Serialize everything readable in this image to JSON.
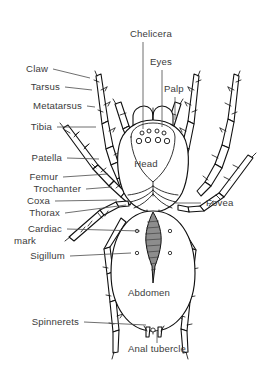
{
  "figure": {
    "view": "dorsal",
    "background_color": "#ffffff",
    "line_color": "#111111",
    "leader_color": "#4a4a4a",
    "text_color": "#3b3b3b"
  },
  "labels_left": [
    {
      "id": "claw",
      "text": "Claw",
      "x": 48,
      "y": 72,
      "leader": {
        "x1": 53,
        "y1": 69,
        "x2": 90,
        "y2": 78
      }
    },
    {
      "id": "tarsus",
      "text": "Tarsus",
      "x": 60,
      "y": 90,
      "leader": {
        "x1": 65,
        "y1": 87,
        "x2": 92,
        "y2": 90
      }
    },
    {
      "id": "metatarsus",
      "text": "Metatarsus",
      "x": 82,
      "y": 109,
      "leader": {
        "x1": 87,
        "y1": 106,
        "x2": 95,
        "y2": 107
      }
    },
    {
      "id": "tibia",
      "text": "Tibia",
      "x": 52,
      "y": 130,
      "leader": {
        "x1": 57,
        "y1": 127,
        "x2": 96,
        "y2": 127
      }
    },
    {
      "id": "patella",
      "text": "Patella",
      "x": 62,
      "y": 161,
      "leader": {
        "x1": 67,
        "y1": 158,
        "x2": 99,
        "y2": 159
      }
    },
    {
      "id": "femur",
      "text": "Femur",
      "x": 58,
      "y": 180,
      "leader": {
        "x1": 63,
        "y1": 177,
        "x2": 108,
        "y2": 174
      }
    },
    {
      "id": "trochanter",
      "text": "Trochanter",
      "x": 81,
      "y": 192,
      "leader": {
        "x1": 86,
        "y1": 189,
        "x2": 112,
        "y2": 187
      }
    },
    {
      "id": "coxa",
      "text": "Coxa",
      "x": 50,
      "y": 204,
      "leader": {
        "x1": 55,
        "y1": 201,
        "x2": 117,
        "y2": 200
      }
    },
    {
      "id": "thorax",
      "text": "Thorax",
      "x": 60,
      "y": 216,
      "leader": {
        "x1": 65,
        "y1": 213,
        "x2": 126,
        "y2": 205
      }
    },
    {
      "id": "cardiac",
      "text": "Cardiac",
      "x": 62,
      "y": 232,
      "leader": {
        "x1": 67,
        "y1": 229,
        "x2": 140,
        "y2": 231
      }
    },
    {
      "id": "cardiac2",
      "text": "mark",
      "x": 47,
      "y": 244,
      "leader": null
    },
    {
      "id": "sigillum",
      "text": "Sigillum",
      "x": 65,
      "y": 259,
      "leader": {
        "x1": 70,
        "y1": 256,
        "x2": 131,
        "y2": 253
      }
    },
    {
      "id": "spinnerets",
      "text": "Spinnerets",
      "x": 79,
      "y": 325,
      "leader": {
        "x1": 84,
        "y1": 322,
        "x2": 146,
        "y2": 325
      }
    }
  ],
  "labels_right": [
    {
      "id": "fovea",
      "text": "Fovea",
      "x": 206,
      "y": 206,
      "leader": {
        "x1": 201,
        "y1": 203,
        "x2": 175,
        "y2": 203
      }
    }
  ],
  "labels_top": [
    {
      "id": "chelicera",
      "text": "Chelicera",
      "x": 130,
      "y": 37,
      "leader": {
        "x1": 143,
        "y1": 42,
        "x2": 143,
        "y2": 129
      }
    },
    {
      "id": "eyes",
      "text": "Eyes",
      "x": 150,
      "y": 65,
      "leader": {
        "x1": 162,
        "y1": 70,
        "x2": 162,
        "y2": 127
      }
    },
    {
      "id": "palp",
      "text": "Palp",
      "x": 164,
      "y": 92,
      "leader": {
        "x1": 175,
        "y1": 97,
        "x2": 175,
        "y2": 120
      }
    }
  ],
  "labels_inline": [
    {
      "id": "head",
      "text": "Head",
      "x": 146,
      "y": 167,
      "anchor": "middle"
    },
    {
      "id": "abdomen",
      "text": "Abdomen",
      "x": 149,
      "y": 296,
      "anchor": "middle"
    },
    {
      "id": "anal-tubercle",
      "text": "Anal tubercle",
      "x": 157,
      "y": 349,
      "anchor": "middle",
      "leader": {
        "x1": 157,
        "y1": 343,
        "x2": 157,
        "y2": 330
      }
    }
  ],
  "anatomy": {
    "eyes_count": 8,
    "eye_rows": [
      {
        "row": "anterior",
        "count": 4,
        "size": "small"
      },
      {
        "row": "posterior",
        "count": 4,
        "size": "large"
      }
    ],
    "legs_count": 8,
    "leg_segments": [
      "Coxa",
      "Trochanter",
      "Femur",
      "Patella",
      "Tibia",
      "Metatarsus",
      "Tarsus",
      "Claw"
    ],
    "body_parts": [
      "Chelicera",
      "Palp",
      "Head",
      "Thorax",
      "Fovea",
      "Cardiac mark",
      "Sigillum",
      "Abdomen",
      "Spinnerets",
      "Anal tubercle"
    ],
    "sigillum_count": 4,
    "spinnerets_count": 2
  }
}
